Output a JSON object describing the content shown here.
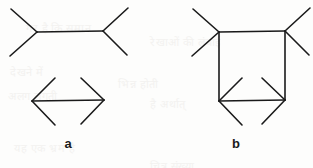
{
  "figure": {
    "background_color": "#fdfdfc",
    "stroke_color": "#1a1a1a",
    "stroke_width": 1.6,
    "width": 313,
    "height": 168,
    "captions": [
      {
        "text": "a",
        "x": 68,
        "y": 143
      },
      {
        "text": "b",
        "x": 236,
        "y": 143
      }
    ],
    "panels": [
      {
        "id": "panel-a",
        "caption": "a",
        "parts": [
          {
            "id": "fins-out-shaft",
            "kind": "line",
            "points": [
              [
                37,
                32
              ],
              [
                103,
                31
              ]
            ]
          },
          {
            "id": "fins-out-left-upper",
            "kind": "line",
            "points": [
              [
                37,
                32
              ],
              [
                11,
                9
              ]
            ]
          },
          {
            "id": "fins-out-left-lower",
            "kind": "line",
            "points": [
              [
                37,
                32
              ],
              [
                10,
                56
              ]
            ]
          },
          {
            "id": "fins-out-right-upper",
            "kind": "line",
            "points": [
              [
                103,
                31
              ],
              [
                128,
                8
              ]
            ]
          },
          {
            "id": "fins-out-right-lower",
            "kind": "line",
            "points": [
              [
                103,
                31
              ],
              [
                127,
                55
              ]
            ]
          },
          {
            "id": "fins-in-shaft",
            "kind": "line",
            "points": [
              [
                32,
                101
              ],
              [
                104,
                100
              ]
            ]
          },
          {
            "id": "fins-in-left-upper",
            "kind": "line",
            "points": [
              [
                32,
                101
              ],
              [
                55,
                78
              ]
            ]
          },
          {
            "id": "fins-in-left-lower",
            "kind": "line",
            "points": [
              [
                32,
                101
              ],
              [
                55,
                125
              ]
            ]
          },
          {
            "id": "fins-in-right-upper",
            "kind": "line",
            "points": [
              [
                104,
                100
              ],
              [
                81,
                78
              ]
            ]
          },
          {
            "id": "fins-in-right-lower",
            "kind": "line",
            "points": [
              [
                104,
                100
              ],
              [
                81,
                124
              ]
            ]
          }
        ]
      },
      {
        "id": "panel-b",
        "caption": "b",
        "parts": [
          {
            "id": "b-fins-out-shaft",
            "kind": "line",
            "points": [
              [
                219,
                32
              ],
              [
                285,
                31
              ]
            ]
          },
          {
            "id": "b-fins-out-left-upper",
            "kind": "line",
            "points": [
              [
                219,
                32
              ],
              [
                193,
                9
              ]
            ]
          },
          {
            "id": "b-fins-out-left-lower",
            "kind": "line",
            "points": [
              [
                219,
                32
              ],
              [
                192,
                56
              ]
            ]
          },
          {
            "id": "b-fins-out-right-upper",
            "kind": "line",
            "points": [
              [
                285,
                31
              ],
              [
                310,
                8
              ]
            ]
          },
          {
            "id": "b-fins-out-right-lower",
            "kind": "line",
            "points": [
              [
                285,
                31
              ],
              [
                309,
                55
              ]
            ]
          },
          {
            "id": "b-left-vertical",
            "kind": "line",
            "points": [
              [
                219,
                32
              ],
              [
                219,
                101
              ]
            ]
          },
          {
            "id": "b-right-vertical",
            "kind": "line",
            "points": [
              [
                285,
                31
              ],
              [
                285,
                100
              ]
            ]
          },
          {
            "id": "b-fins-in-shaft",
            "kind": "line",
            "points": [
              [
                219,
                101
              ],
              [
                285,
                100
              ]
            ]
          },
          {
            "id": "b-fins-in-left-upper",
            "kind": "line",
            "points": [
              [
                219,
                101
              ],
              [
                242,
                78
              ]
            ]
          },
          {
            "id": "b-fins-in-left-lower",
            "kind": "line",
            "points": [
              [
                219,
                101
              ],
              [
                242,
                125
              ]
            ]
          },
          {
            "id": "b-fins-in-right-upper",
            "kind": "line",
            "points": [
              [
                285,
                100
              ],
              [
                262,
                78
              ]
            ]
          },
          {
            "id": "b-fins-in-right-lower",
            "kind": "line",
            "points": [
              [
                285,
                100
              ],
              [
                262,
                124
              ]
            ]
          }
        ]
      }
    ],
    "bleed_through_text": [
      {
        "text": "गर है कि समान",
        "x": 26,
        "y": 20
      },
      {
        "text": "रेखाओं की लंबाई",
        "x": 150,
        "y": 34
      },
      {
        "text": "देखने में",
        "x": 10,
        "y": 64
      },
      {
        "text": "भिन्न होती",
        "x": 118,
        "y": 76
      },
      {
        "text": "अलग लगती",
        "x": 8,
        "y": 88
      },
      {
        "text": "है अर्थात्",
        "x": 150,
        "y": 96
      },
      {
        "text": "यह एक भ्रम है",
        "x": 14,
        "y": 140
      },
      {
        "text": "चित्र संख्या",
        "x": 150,
        "y": 158
      }
    ]
  }
}
